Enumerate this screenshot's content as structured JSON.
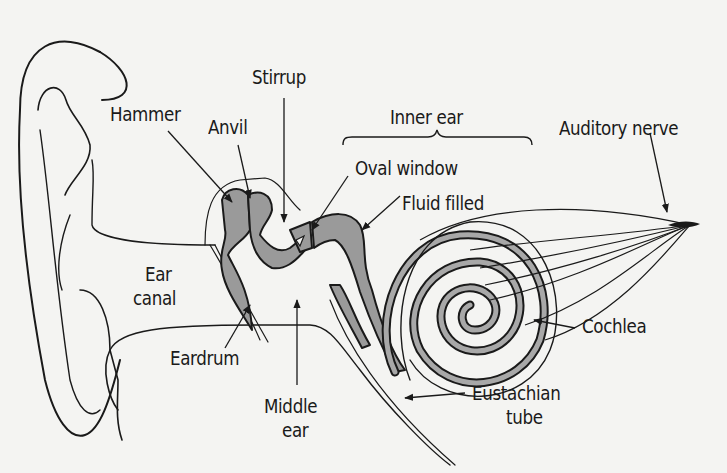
{
  "diagram": {
    "colors": {
      "background": "#f4f4f2",
      "line": "#1a1a1a",
      "fill_bone": "#9a9a9a",
      "fill_cochlea": "#a8a8a8"
    },
    "labels": {
      "stirrup": "Stirrup",
      "hammer": "Hammer",
      "anvil": "Anvil",
      "inner_ear": "Inner ear",
      "auditory_nerve": "Auditory nerve",
      "oval_window": "Oval window",
      "fluid_filled": "Fluid filled",
      "ear_canal_1": "Ear",
      "ear_canal_2": "canal",
      "cochlea": "Cochlea",
      "eardrum": "Eardrum",
      "middle_ear_1": "Middle",
      "middle_ear_2": "ear",
      "eustachian_tube_1": "Eustachian",
      "eustachian_tube_2": "tube"
    }
  }
}
